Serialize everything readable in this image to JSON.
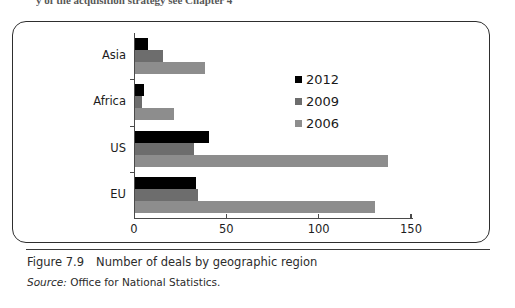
{
  "page": {
    "top_cut_text": "y of the acquisition strategy see Chapter 4"
  },
  "figure": {
    "number_label": "Figure 7.9",
    "caption": "Number of deals by geographic region",
    "source_prefix": "Source:",
    "source_text": "Office for National Statistics."
  },
  "legend": {
    "position": "inside-top-right",
    "items": [
      {
        "label": "2012",
        "color": "#000000"
      },
      {
        "label": "2009",
        "color": "#6d6d6d"
      },
      {
        "label": "2006",
        "color": "#8d8d8d"
      }
    ]
  },
  "axis": {
    "x_ticks": [
      "0",
      "50",
      "100",
      "150"
    ],
    "x_min": 0,
    "x_max": 150
  },
  "chart_data": {
    "type": "bar",
    "orientation": "horizontal",
    "title": "Number of deals by geographic region",
    "xlabel": "",
    "ylabel": "",
    "xlim": [
      0,
      150
    ],
    "grid": false,
    "legend_position": "inside-top-right",
    "categories": [
      "Asia",
      "Africa",
      "US",
      "EU"
    ],
    "series": [
      {
        "name": "2012",
        "color": "#000000",
        "values": [
          7,
          5,
          40,
          33
        ]
      },
      {
        "name": "2009",
        "color": "#6d6d6d",
        "values": [
          15,
          4,
          32,
          34
        ]
      },
      {
        "name": "2006",
        "color": "#8d8d8d",
        "values": [
          38,
          21,
          137,
          130
        ]
      }
    ]
  }
}
